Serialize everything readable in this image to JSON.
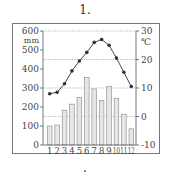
{
  "title": "1.",
  "chart_data": {
    "type": "bar+line",
    "title": "1.",
    "categories": [
      "1",
      "2",
      "3",
      "4",
      "5",
      "6",
      "7",
      "8",
      "9",
      "10",
      "11",
      "12"
    ],
    "series": [
      {
        "name": "precipitation",
        "kind": "bar",
        "axis": "left",
        "unit": "mm",
        "values": [
          100,
          105,
          183,
          215,
          250,
          355,
          295,
          235,
          308,
          245,
          162,
          85
        ]
      },
      {
        "name": "temperature",
        "kind": "line",
        "axis": "right",
        "unit": "℃",
        "values": [
          8,
          8.5,
          11.5,
          16,
          19.5,
          22.5,
          26,
          27,
          25,
          20.5,
          15.5,
          10.5
        ]
      }
    ],
    "left_axis": {
      "label": "mm",
      "ticks": [
        0,
        100,
        200,
        300,
        400,
        500,
        600
      ],
      "range": [
        0,
        600
      ]
    },
    "right_axis": {
      "label": "℃",
      "ticks": [
        -10,
        0,
        10,
        20,
        30
      ],
      "range": [
        -10,
        30
      ]
    },
    "gridlines": {
      "style": "dotted",
      "at_right_ticks": [
        0,
        10,
        20,
        30
      ]
    },
    "xlabel": "",
    "legend": "none"
  },
  "colors": {
    "bar_fill": "#e6e6e6",
    "bar_stroke": "#888888",
    "line": "#333333",
    "axis": "#555555",
    "grid": "#999999"
  }
}
